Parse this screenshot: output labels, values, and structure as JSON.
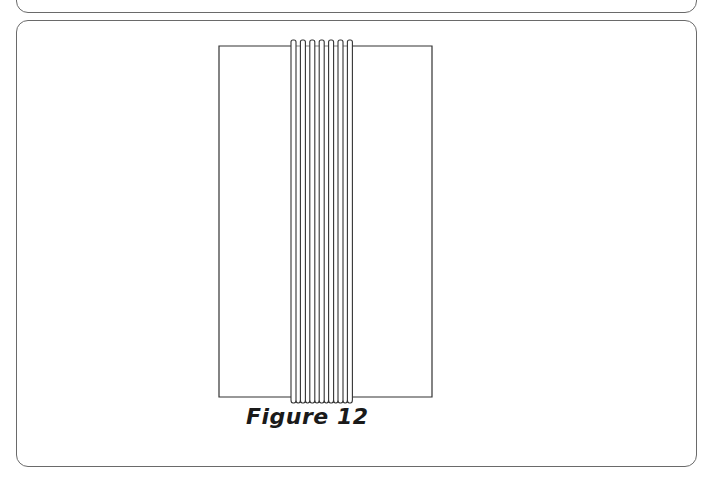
{
  "figure": {
    "caption": "Figure 12",
    "stroke_color": "#333333",
    "panel_border_color": "#6a6a6a",
    "frame": {
      "x": 219,
      "y": 46,
      "width": 213,
      "height": 351
    },
    "strands": {
      "count": 7,
      "start_x": 291,
      "pitch": 9.4,
      "loop_width": 5,
      "top_y": 40,
      "bottom_y": 403
    }
  }
}
